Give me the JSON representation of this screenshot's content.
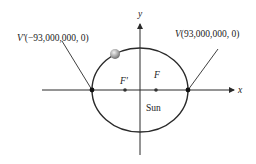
{
  "diagram": {
    "title": "",
    "axes": {
      "x_label": "x",
      "y_label": "y"
    },
    "vertices": {
      "left": {
        "name": "V'",
        "coords": "(−93,000,000, 0)"
      },
      "right": {
        "name": "V",
        "coords": "(93,000,000, 0)"
      }
    },
    "foci": {
      "left": "F'",
      "right": "F"
    },
    "sun_label": "Sun",
    "colors": {
      "line": "#2a2a2a",
      "planet": "#9a9a9a",
      "background": "#ffffff"
    }
  }
}
